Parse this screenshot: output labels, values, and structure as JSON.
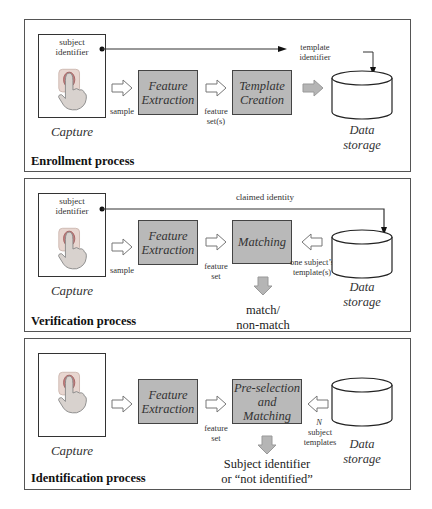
{
  "enrollment": {
    "title": "Enrollment process",
    "capture_label": "Capture",
    "capture_identifier": "subject identifier",
    "sample_label": "sample",
    "feature_extraction": "Feature Extraction",
    "feature_set_label": "feature set(s)",
    "template_creation": "Template Creation",
    "template_identifier": "template identifier",
    "data_storage": "Data storage"
  },
  "verification": {
    "title": "Verification process",
    "capture_label": "Capture",
    "capture_identifier": "subject identifier",
    "claimed_identity": "claimed identity",
    "sample_label": "sample",
    "feature_extraction": "Feature Extraction",
    "feature_set_label": "feature set",
    "matching": "Matching",
    "templates_label": "one subject’s template(s)",
    "data_storage": "Data storage",
    "result": "match/ non-match"
  },
  "identification": {
    "title": "Identification process",
    "capture_label": "Capture",
    "feature_extraction": "Feature Extraction",
    "feature_set_label": "feature set",
    "matching": "Pre-selection and Matching",
    "templates_n": "N",
    "templates_label": "subject templates",
    "data_storage": "Data storage",
    "result_line1": "Subject identifier",
    "result_line2": "or “not identified”"
  },
  "colors": {
    "process_box": "#b9b9b9",
    "gray_arrow": "#b5b5b5",
    "border": "#444444"
  },
  "icons": {
    "capture": "fingerprint-touch-icon",
    "storage": "database-cylinder-icon"
  }
}
